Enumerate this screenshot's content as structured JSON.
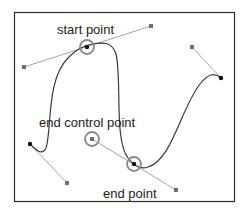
{
  "diagram": {
    "type": "bezier-curve-illustration",
    "labels": {
      "start_point": "start point",
      "end_control_point": "end control point",
      "end_point": "end point"
    },
    "colors": {
      "frame": "#2b2b2b",
      "curve": "#3a3a3a",
      "handle_line": "#9a9a9a",
      "anchor": "#111111",
      "control_point": "#6e6e6e",
      "highlight_circle": "#8a8a8a",
      "background": "#ffffff"
    },
    "anchors": [
      {
        "name": "left-anchor",
        "x": 30,
        "y": 144
      },
      {
        "name": "start-point",
        "x": 87,
        "y": 46
      },
      {
        "name": "end-point",
        "x": 134,
        "y": 164
      },
      {
        "name": "right-anchor",
        "x": 221,
        "y": 78
      }
    ],
    "control_points": [
      {
        "name": "left-handle",
        "x": 67,
        "y": 183
      },
      {
        "name": "start-handle-out",
        "x": 151,
        "y": 26
      },
      {
        "name": "start-handle-in",
        "x": 24,
        "y": 67
      },
      {
        "name": "end-control-point",
        "x": 92,
        "y": 139
      },
      {
        "name": "end-handle-out",
        "x": 176,
        "y": 190
      },
      {
        "name": "right-handle",
        "x": 192,
        "y": 47
      }
    ]
  }
}
